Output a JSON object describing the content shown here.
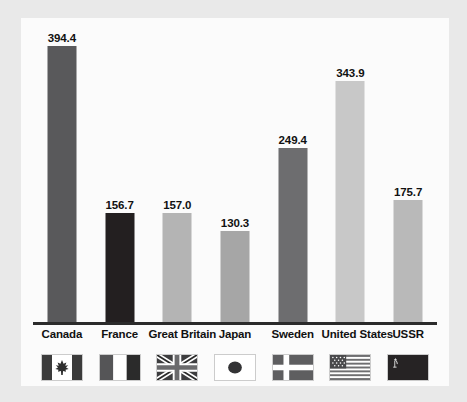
{
  "chart_data": {
    "type": "bar",
    "title": "",
    "subtitle": "",
    "xlabel": "",
    "ylabel": "Energy consumption in Btu",
    "ylim": [
      0,
      420
    ],
    "grid": false,
    "legend": "none",
    "axis_line": true,
    "categories": [
      "Canada",
      "France",
      "Great Britain",
      "Japan",
      "Sweden",
      "United States",
      "USSR"
    ],
    "values": [
      394.4,
      156.7,
      157.0,
      130.3,
      249.4,
      343.9,
      175.7
    ],
    "value_labels": [
      "394.4",
      "156.7",
      "157.0",
      "130.3",
      "249.4",
      "343.9",
      "175.7"
    ],
    "bar_colors": [
      "#59595b",
      "#231f20",
      "#b4b4b4",
      "#a6a6a6",
      "#6d6d6f",
      "#c8c8c8",
      "#b9b9b9"
    ],
    "icons": [
      "flag-canada-icon",
      "flag-france-icon",
      "flag-great-britain-icon",
      "flag-japan-icon",
      "flag-sweden-icon",
      "flag-united-states-icon",
      "flag-ussr-icon"
    ]
  },
  "style": {
    "frame_background": "#e9e9e9",
    "panel_background": "#fbfbfb",
    "axis_color": "#2b2b2b",
    "text_color": "#111111"
  }
}
